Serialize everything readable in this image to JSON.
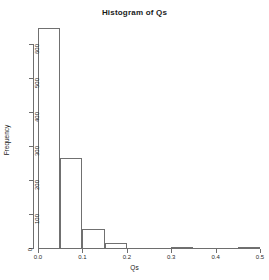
{
  "chart_data": {
    "type": "bar",
    "title": "Histogram of Qs",
    "xlabel": "Qs",
    "ylabel": "Frequency",
    "xlim": [
      0.0,
      0.5
    ],
    "ylim": [
      0,
      650
    ],
    "grid": false,
    "legend": false,
    "binwidth": 0.05,
    "bin_edges": [
      0.0,
      0.05,
      0.1,
      0.15,
      0.2,
      0.25,
      0.3,
      0.35,
      0.4,
      0.45,
      0.5
    ],
    "categories": [
      "0.00-0.05",
      "0.05-0.10",
      "0.10-0.15",
      "0.15-0.20",
      "0.20-0.25",
      "0.25-0.30",
      "0.30-0.35",
      "0.35-0.40",
      "0.40-0.45",
      "0.45-0.50"
    ],
    "values": [
      647,
      265,
      56,
      15,
      0,
      0,
      3,
      0,
      0,
      3
    ],
    "xticks": [
      0.0,
      0.1,
      0.2,
      0.3,
      0.4,
      0.5
    ],
    "xtick_labels": [
      "0.0",
      "0.1",
      "0.2",
      "0.3",
      "0.4",
      "0.5"
    ],
    "yticks": [
      0,
      100,
      200,
      300,
      400,
      500,
      600
    ],
    "ytick_labels": [
      "0",
      "100",
      "200",
      "300",
      "400",
      "500",
      "600"
    ],
    "bar_color": "transparent",
    "bar_edge_color": "#707070",
    "axis_color": "#6e6e6e",
    "background": "#ffffff"
  }
}
